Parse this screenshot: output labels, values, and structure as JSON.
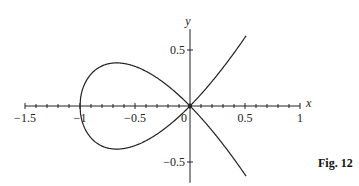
{
  "figure_label": "Fig. 12",
  "chart_data": {
    "type": "line",
    "title": "",
    "equation": "y^2 = x^2 (x + 1)",
    "xlabel": "x",
    "ylabel": "y",
    "xlim": [
      -1.5,
      1
    ],
    "ylim": [
      -0.65,
      0.65
    ],
    "x_ticks": [
      -1.5,
      -1,
      -0.5,
      0,
      0.5,
      1
    ],
    "x_tick_labels": [
      "−1.5",
      "−1",
      "−0.5",
      "0",
      "0.5",
      "1"
    ],
    "y_ticks": [
      0.5,
      -0.5
    ],
    "y_tick_labels": [
      "0.5",
      "−0.5"
    ],
    "minor_tick_step_x": 0.1,
    "grid": false,
    "legend": null,
    "series": [
      {
        "name": "upper branch (loop top + right rising branch)",
        "x": [
          -1,
          -0.9,
          -0.8,
          -0.667,
          -0.5,
          -0.3,
          0,
          0.2,
          0.4,
          0.51
        ],
        "y": [
          0,
          0.285,
          0.358,
          0.385,
          0.354,
          0.251,
          0,
          -0.219,
          -0.473,
          -0.627
        ]
      },
      {
        "name": "lower branch (loop bottom + right falling branch)",
        "x": [
          -1,
          -0.9,
          -0.8,
          -0.667,
          -0.5,
          -0.3,
          0,
          0.2,
          0.4,
          0.51
        ],
        "y": [
          0,
          -0.285,
          -0.358,
          -0.385,
          -0.354,
          -0.251,
          0,
          0.219,
          0.473,
          0.627
        ]
      }
    ]
  }
}
